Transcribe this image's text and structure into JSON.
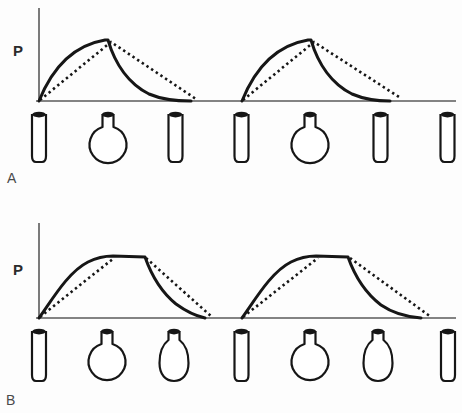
{
  "figure": {
    "colors": {
      "background": "#fdfdfd",
      "ink": "#161616",
      "axis": "#5a5a5a",
      "label_text": "#4a4a4a"
    },
    "stroke": {
      "solid_width": 3,
      "dotted_width": 2.6,
      "dotted_dash": "2.4 3.2",
      "axis_width": 1.6,
      "vessel_width": 2.2
    },
    "panels": [
      {
        "id": "A",
        "label": "A",
        "axis_label": "P",
        "height": 200,
        "y_axis": {
          "x": 39,
          "y1": 8,
          "y2": 101
        },
        "x_axis": {
          "x1": 36,
          "x2": 456,
          "y": 101
        },
        "curves": [
          {
            "name": "pulse-1",
            "solid": "M 39 101 C 53 66 75 45 105 40 L 108 40 C 115 64 129 84 149 94 C 163 100 177 101 191 101",
            "dotted": "M 40 100 L 111 42 L 196 99"
          },
          {
            "name": "pulse-2",
            "solid": "M 242 101 C 256 66 278 45 308 40 L 311 40 C 318 64 332 84 352 94 C 366 100 379 101 390 101",
            "dotted": "M 243 100 L 314 42 L 399 97"
          }
        ],
        "vessel_top": 112,
        "vessel_bottom": 162,
        "vessels": [
          {
            "type": "tube",
            "x": 39
          },
          {
            "type": "round-flask",
            "x": 108
          },
          {
            "type": "tube",
            "x": 175.5
          },
          {
            "type": "tube",
            "x": 241.5
          },
          {
            "type": "round-flask",
            "x": 310
          },
          {
            "type": "tube",
            "x": 380.5
          },
          {
            "type": "tube",
            "x": 447.5
          }
        ]
      },
      {
        "id": "B",
        "label": "B",
        "axis_label": "P",
        "height": 213,
        "y_axis": {
          "x": 39,
          "y1": 23,
          "y2": 118
        },
        "x_axis": {
          "x1": 36,
          "x2": 456,
          "y": 118
        },
        "curves": [
          {
            "name": "pulse-1",
            "solid": "M 39 118 C 52 100 68 72 88 62 C 96 58 104 56 113 56 L 145 57 C 151 74 160 91 176 104 C 187 112 196 116 205 118",
            "dotted": "M 40 117 L 114 58 M 146 58 L 212 117"
          },
          {
            "name": "pulse-2",
            "solid": "M 242 118 C 255 100 271 72 291 62 C 299 58 307 56 316 56 L 348 57 C 354 74 364 92 381 105 C 394 114 408 117 421 118",
            "dotted": "M 243 117 L 318 58 M 350 58 L 431 117"
          }
        ],
        "vessel_top": 129,
        "vessel_bottom": 181,
        "vessels": [
          {
            "type": "tube",
            "x": 39
          },
          {
            "type": "round-flask",
            "x": 107
          },
          {
            "type": "pear-flask",
            "x": 174
          },
          {
            "type": "tube",
            "x": 241.5
          },
          {
            "type": "round-flask",
            "x": 310
          },
          {
            "type": "pear-flask",
            "x": 378
          },
          {
            "type": "tube",
            "x": 448
          }
        ]
      }
    ]
  }
}
